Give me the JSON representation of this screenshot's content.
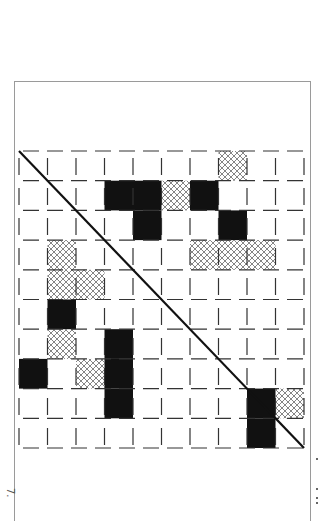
{
  "figure": {
    "caption_fragment": "7.",
    "grid": {
      "rows": 10,
      "cols": 10,
      "origin_x": 19,
      "origin_y": 151,
      "cell_w": 28.5,
      "cell_h": 29.7,
      "line_style": "dashed",
      "diagonal": "top-left to bottom-right"
    },
    "cells": [
      {
        "row": 0,
        "col": 7,
        "fill": "hatch"
      },
      {
        "row": 1,
        "col": 3,
        "fill": "black"
      },
      {
        "row": 1,
        "col": 4,
        "fill": "black"
      },
      {
        "row": 1,
        "col": 5,
        "fill": "hatch"
      },
      {
        "row": 1,
        "col": 6,
        "fill": "black"
      },
      {
        "row": 2,
        "col": 4,
        "fill": "black"
      },
      {
        "row": 2,
        "col": 7,
        "fill": "black"
      },
      {
        "row": 3,
        "col": 1,
        "fill": "hatch"
      },
      {
        "row": 3,
        "col": 6,
        "fill": "hatch"
      },
      {
        "row": 3,
        "col": 7,
        "fill": "hatch"
      },
      {
        "row": 3,
        "col": 8,
        "fill": "hatch"
      },
      {
        "row": 4,
        "col": 1,
        "fill": "hatch"
      },
      {
        "row": 4,
        "col": 2,
        "fill": "hatch"
      },
      {
        "row": 5,
        "col": 1,
        "fill": "black"
      },
      {
        "row": 6,
        "col": 1,
        "fill": "hatch"
      },
      {
        "row": 6,
        "col": 3,
        "fill": "black"
      },
      {
        "row": 7,
        "col": 0,
        "fill": "black"
      },
      {
        "row": 7,
        "col": 2,
        "fill": "hatch"
      },
      {
        "row": 7,
        "col": 3,
        "fill": "black"
      },
      {
        "row": 8,
        "col": 3,
        "fill": "black"
      },
      {
        "row": 8,
        "col": 8,
        "fill": "black"
      },
      {
        "row": 8,
        "col": 9,
        "fill": "hatch"
      },
      {
        "row": 9,
        "col": 8,
        "fill": "black"
      }
    ],
    "colors": {
      "black_cell": "#111111",
      "hatch_line": "#777777",
      "grid_line": "#333333",
      "diagonal": "#111111",
      "frame": "#9a9a9a"
    }
  }
}
